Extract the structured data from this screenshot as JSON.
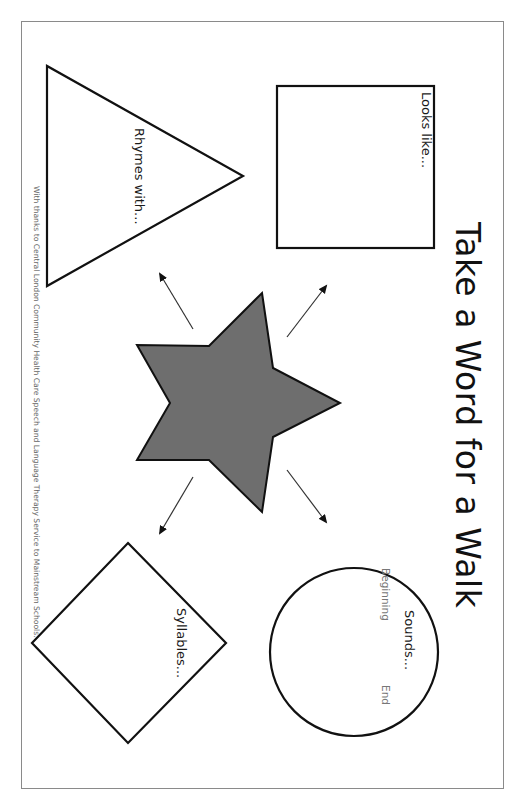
{
  "title": "Take a Word for a Walk",
  "orientation": "rotated-90-clockwise",
  "shapes": {
    "square": {
      "label": "Looks like..."
    },
    "triangle": {
      "label": "Rhymes with..."
    },
    "circle": {
      "label": "Sounds...",
      "sub_left": "Beginning",
      "sub_right": "End"
    },
    "diamond": {
      "label": "Syllables..."
    },
    "star": {
      "fill": "#6e6e6e",
      "role": "center-word"
    }
  },
  "credit": "With thanks to Central London Community Health Care Speech and Language Therapy Service to Mainstream Schools.",
  "colors": {
    "stroke": "#111111",
    "star_fill": "#6e6e6e",
    "border": "#8a8a8a"
  }
}
